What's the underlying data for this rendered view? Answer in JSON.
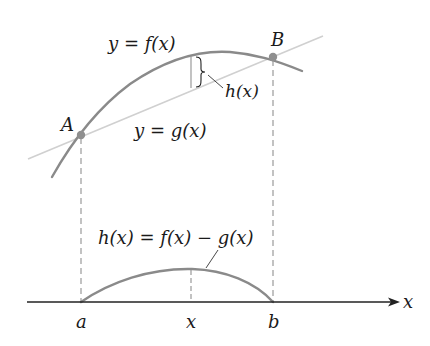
{
  "figure": {
    "colors": {
      "curve": "#8a8a8a",
      "line": "#cfcfcf",
      "points": "#8f8f8f",
      "axis": "#222222",
      "dashed": "#9a9a9a",
      "text": "#1a1a1a"
    }
  },
  "labels": {
    "f_curve": "y = f(x)",
    "g_line": "y = g(x)",
    "point_A": "A",
    "point_B": "B",
    "h_bracket": "h(x)",
    "h_equation": "h(x) = f(x) − g(x)",
    "x_axis": "x",
    "tick_a": "a",
    "tick_x": "x",
    "tick_b": "b"
  }
}
